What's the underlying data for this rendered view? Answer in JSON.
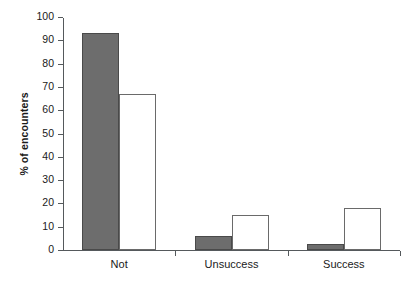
{
  "chart_data": {
    "type": "bar",
    "title": "",
    "subtitle": "",
    "xlabel": "",
    "ylabel": "% of encounters",
    "categories": [
      "Not",
      "Unsuccess",
      "Success"
    ],
    "series": [
      {
        "name": "filled",
        "style": "solid-gray",
        "values": [
          93,
          6,
          2.5
        ]
      },
      {
        "name": "open",
        "style": "white-outline",
        "values": [
          67,
          15,
          18
        ]
      }
    ],
    "ylim": [
      0,
      100
    ],
    "ytick_step": 10,
    "yticks": [
      0,
      10,
      20,
      30,
      40,
      50,
      60,
      70,
      80,
      90,
      100
    ],
    "ytick_labels": [
      "0",
      "10",
      "20",
      "30",
      "40",
      "50",
      "60",
      "70",
      "80",
      "90",
      "100"
    ],
    "grid": false,
    "legend": "none",
    "colors": {
      "filled_bar": "#6d6d6d",
      "filled_bar_edge": "#4a4a4a",
      "open_bar_fill": "#ffffff",
      "open_bar_edge": "#6a6a6a",
      "axis": "#55595c",
      "text": "#1a1a1a",
      "background": "#ffffff"
    }
  }
}
